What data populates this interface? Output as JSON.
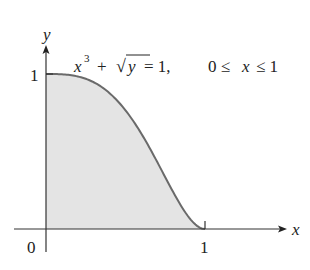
{
  "chart_data": {
    "type": "area",
    "title": "",
    "annotation": "x³ + √y = 1,  0 ≤ x ≤ 1",
    "equation": "x^3 + sqrt(y) = 1",
    "domain": "0 ≤ x ≤ 1",
    "xlabel": "x",
    "ylabel": "y",
    "x_ticks": [
      "0",
      "1"
    ],
    "y_ticks": [
      "1"
    ],
    "origin_label": "0",
    "xlim": [
      0,
      1
    ],
    "ylim": [
      0,
      1
    ],
    "grid": false,
    "legend": null,
    "series": [
      {
        "name": "y = (1 - x^3)^2",
        "x": [
          0,
          0.1,
          0.2,
          0.3,
          0.4,
          0.5,
          0.6,
          0.7,
          0.8,
          0.9,
          1.0
        ],
        "y": [
          1.0,
          0.998,
          0.984,
          0.947,
          0.876,
          0.766,
          0.612,
          0.432,
          0.239,
          0.073,
          0.0
        ],
        "fill": "region under curve shaded gray"
      }
    ],
    "colors": {
      "curve": "#6a6a6a",
      "fill": "#e4e4e4",
      "axes": "#333333"
    }
  },
  "labels": {
    "y_axis": "y",
    "x_axis": "x",
    "y_tick_1": "1",
    "x_tick_1": "1",
    "origin": "0",
    "eq_x": "x",
    "eq_exp": "3",
    "eq_plus": "+",
    "eq_rad": "√",
    "eq_y": "y",
    "eq_rest": "= 1,",
    "eq_domain_0": "0 ≤",
    "eq_domain_x": "x",
    "eq_domain_le": "≤ 1"
  }
}
